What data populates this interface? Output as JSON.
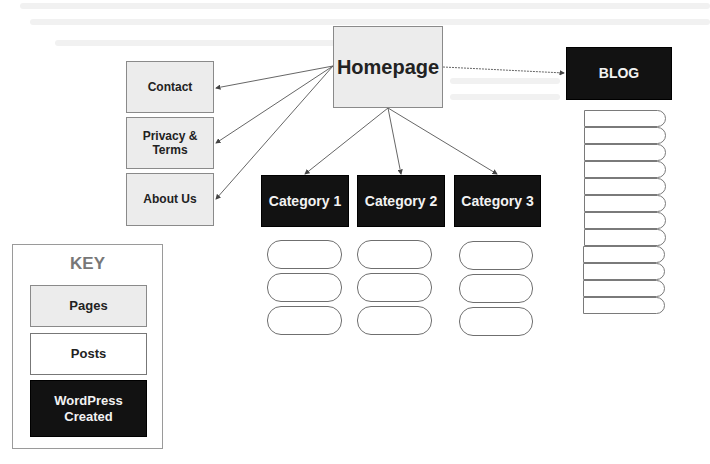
{
  "diagram": {
    "nodes": {
      "homepage": {
        "label": "Homepage",
        "type": "page"
      },
      "contact": {
        "label": "Contact",
        "type": "page"
      },
      "privacy": {
        "label": "Privacy & Terms",
        "type": "page"
      },
      "about": {
        "label": "About Us",
        "type": "page"
      },
      "blog": {
        "label": "BLOG",
        "type": "wordpress"
      },
      "category1": {
        "label": "Category 1",
        "type": "wordpress"
      },
      "category2": {
        "label": "Category 2",
        "type": "wordpress"
      },
      "category3": {
        "label": "Category 3",
        "type": "wordpress"
      }
    },
    "edges": [
      {
        "from": "homepage",
        "to": "contact"
      },
      {
        "from": "homepage",
        "to": "privacy"
      },
      {
        "from": "homepage",
        "to": "about"
      },
      {
        "from": "homepage",
        "to": "blog"
      },
      {
        "from": "homepage",
        "to": "category1"
      },
      {
        "from": "homepage",
        "to": "category2"
      },
      {
        "from": "homepage",
        "to": "category3"
      }
    ],
    "category_posts_per_column": 3,
    "blog_posts_count": 12
  },
  "key": {
    "title": "KEY",
    "items": [
      {
        "label": "Pages",
        "style": "page"
      },
      {
        "label": "Posts",
        "style": "post"
      },
      {
        "label": "WordPress Created",
        "style": "wordpress"
      }
    ]
  },
  "colors": {
    "page_fill": "#ececec",
    "wordpress_fill": "#121212",
    "post_fill": "#ffffff",
    "line": "#555555"
  }
}
